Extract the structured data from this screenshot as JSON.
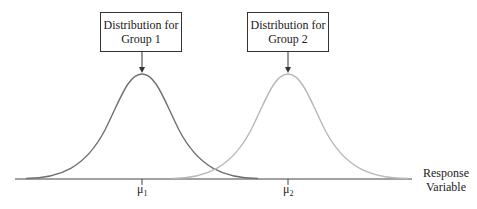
{
  "diagram": {
    "type": "overlapping-normal-distributions",
    "boxes": [
      {
        "line1": "Distribution for",
        "line2": "Group 1"
      },
      {
        "line1": "Distribution for",
        "line2": "Group 2"
      }
    ],
    "axis_label": {
      "line1": "Response",
      "line2": "Variable"
    },
    "ticks": [
      {
        "symbol": "μ",
        "subscript": "1"
      },
      {
        "symbol": "μ",
        "subscript": "2"
      }
    ],
    "colors": {
      "curve1": "#707070",
      "curve2": "#b8b8b8",
      "axis": "#444444"
    }
  }
}
